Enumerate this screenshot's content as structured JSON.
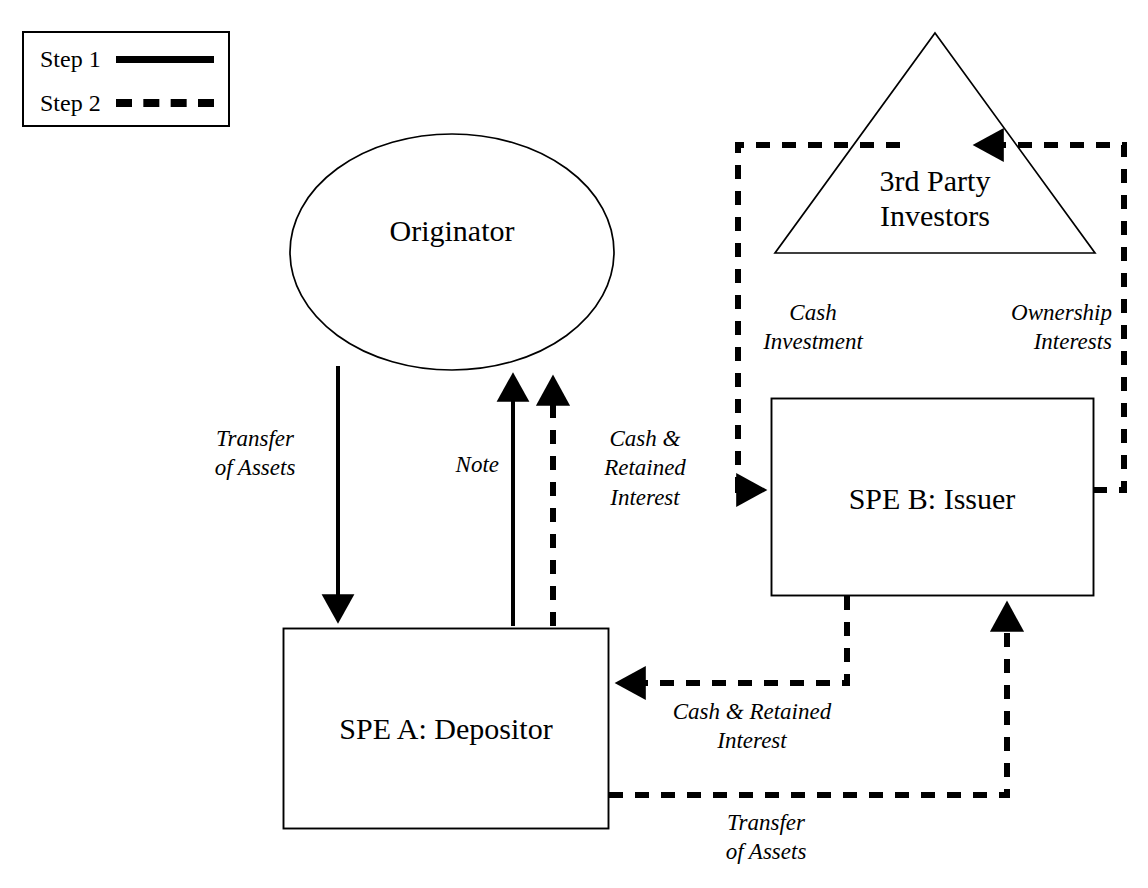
{
  "diagram": {
    "background_color": "#ffffff",
    "line_color": "#000000",
    "legend": {
      "name": "step-legend",
      "items": [
        {
          "label": "Step 1",
          "style": "solid"
        },
        {
          "label": "Step 2",
          "style": "dashed"
        }
      ]
    },
    "nodes": [
      {
        "id": "originator",
        "label": "Originator",
        "shape": "ellipse"
      },
      {
        "id": "third_party_investors",
        "label": "3rd Party\nInvestors",
        "shape": "triangle"
      },
      {
        "id": "spe_a",
        "label": "SPE A: Depositor",
        "shape": "rectangle"
      },
      {
        "id": "spe_b",
        "label": "SPE B: Issuer",
        "shape": "rectangle"
      }
    ],
    "edges": [
      {
        "id": "transfer-of-assets-step1",
        "label": "Transfer\nof Assets",
        "from": "originator",
        "to": "spe_a",
        "style": "solid",
        "step": "Step 1"
      },
      {
        "id": "note",
        "label": "Note",
        "from": "spe_a",
        "to": "originator",
        "style": "solid",
        "step": "Step 1"
      },
      {
        "id": "cash-retained-interest-to-originator",
        "label": "Cash &\nRetained\nInterest",
        "from": "spe_a",
        "to": "originator",
        "style": "dashed",
        "step": "Step 2"
      },
      {
        "id": "cash-investment",
        "label": "Cash\nInvestment",
        "from": "third_party_investors",
        "to": "spe_b",
        "style": "dashed",
        "step": "Step 2"
      },
      {
        "id": "ownership-interests",
        "label": "Ownership\nInterests",
        "from": "spe_b",
        "to": "third_party_investors",
        "style": "dashed",
        "step": "Step 2"
      },
      {
        "id": "cash-retained-interest-to-spe-a",
        "label": "Cash & Retained\nInterest",
        "from": "spe_b",
        "to": "spe_a",
        "style": "dashed",
        "step": "Step 2"
      },
      {
        "id": "transfer-of-assets-step2",
        "label": "Transfer\nof Assets",
        "from": "spe_a",
        "to": "spe_b",
        "style": "dashed",
        "step": "Step 2"
      }
    ]
  }
}
